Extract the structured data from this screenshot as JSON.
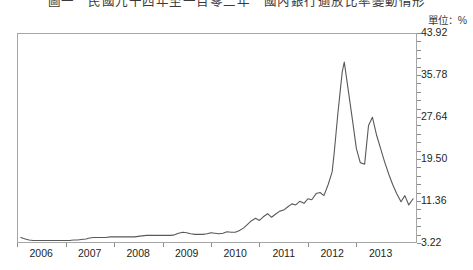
{
  "chart_data": {
    "type": "line",
    "title": "圖一　民國九十四年至一百零二年　國內銀行逾放比率變動情形",
    "subtitle": "",
    "unit_label": "單位：%",
    "xlabel": "",
    "ylabel": "",
    "grid": false,
    "legend_position": "none",
    "line_color": "#595959",
    "axis_color": "#a6a6a6",
    "text_color": "#231f20",
    "xlim": [
      "2005.50",
      "2013.75"
    ],
    "ylim": [
      3.22,
      43.92
    ],
    "ytick_labels": [
      "43.92",
      "35.78",
      "27.64",
      "19.50",
      "11.36",
      "3.22"
    ],
    "ytick_values": [
      43.92,
      35.78,
      27.64,
      19.5,
      11.36,
      3.22
    ],
    "xtick_labels": [
      "2006",
      "2007",
      "2008",
      "2009",
      "2010",
      "2011",
      "2012",
      "2013"
    ],
    "xtick_values": [
      2006,
      2007,
      2008,
      2009,
      2010,
      2011,
      2012,
      2013
    ],
    "series": [
      {
        "name": "比率",
        "x": [
          2005.58,
          2005.67,
          2005.75,
          2005.83,
          2005.92,
          2006.0,
          2006.08,
          2006.17,
          2006.25,
          2006.33,
          2006.42,
          2006.5,
          2006.58,
          2006.67,
          2006.75,
          2006.83,
          2006.92,
          2007.0,
          2007.08,
          2007.17,
          2007.25,
          2007.33,
          2007.42,
          2007.5,
          2007.58,
          2007.67,
          2007.75,
          2007.83,
          2007.92,
          2008.0,
          2008.08,
          2008.17,
          2008.25,
          2008.33,
          2008.42,
          2008.5,
          2008.58,
          2008.67,
          2008.75,
          2008.83,
          2008.92,
          2009.0,
          2009.08,
          2009.17,
          2009.25,
          2009.33,
          2009.42,
          2009.5,
          2009.58,
          2009.67,
          2009.75,
          2009.83,
          2009.92,
          2010.0,
          2010.08,
          2010.17,
          2010.25,
          2010.33,
          2010.42,
          2010.5,
          2010.58,
          2010.67,
          2010.75,
          2010.83,
          2010.92,
          2011.0,
          2011.08,
          2011.17,
          2011.25,
          2011.33,
          2011.42,
          2011.5,
          2011.58,
          2011.67,
          2011.75,
          2011.83,
          2011.92,
          2012.0,
          2012.04,
          2012.08,
          2012.12,
          2012.17,
          2012.21,
          2012.25,
          2012.33,
          2012.42,
          2012.5,
          2012.58,
          2012.67,
          2012.75,
          2012.83,
          2012.92,
          2013.0,
          2013.08,
          2013.17,
          2013.25,
          2013.33,
          2013.42,
          2013.5,
          2013.58,
          2013.67
        ],
        "values": [
          4.3,
          4.0,
          3.8,
          3.7,
          3.7,
          3.7,
          3.7,
          3.7,
          3.7,
          3.7,
          3.7,
          3.7,
          3.7,
          3.8,
          3.8,
          3.9,
          4.0,
          4.2,
          4.3,
          4.3,
          4.3,
          4.3,
          4.4,
          4.4,
          4.4,
          4.4,
          4.4,
          4.4,
          4.4,
          4.5,
          4.6,
          4.7,
          4.7,
          4.7,
          4.7,
          4.7,
          4.7,
          4.7,
          4.8,
          5.1,
          5.3,
          5.2,
          5.0,
          4.9,
          4.9,
          4.9,
          5.0,
          5.2,
          5.1,
          5.0,
          5.1,
          5.4,
          5.3,
          5.3,
          5.6,
          6.1,
          6.8,
          7.5,
          8.0,
          7.6,
          8.3,
          8.9,
          8.2,
          8.8,
          9.4,
          9.6,
          10.2,
          10.8,
          10.6,
          11.3,
          10.9,
          11.8,
          11.6,
          12.8,
          13.0,
          12.4,
          14.6,
          17.0,
          20.5,
          24.5,
          28.5,
          33.0,
          36.5,
          38.3,
          33.0,
          27.0,
          21.5,
          18.8,
          18.5,
          26.0,
          27.6,
          24.0,
          21.5,
          19.0,
          16.5,
          14.5,
          12.8,
          11.2,
          12.4,
          10.6,
          11.8
        ]
      }
    ]
  }
}
